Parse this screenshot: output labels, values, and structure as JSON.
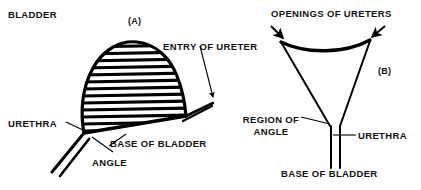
{
  "figure": {
    "background_color": "#ffffff",
    "ink_color": "#000000",
    "panels": [
      {
        "tag": "(A)",
        "view": "lateral-view-of-bladder",
        "labels": [
          {
            "name": "bladder",
            "text": "BLADDER"
          },
          {
            "name": "entry-of-ureter",
            "text": "ENTRY OF URETER"
          },
          {
            "name": "urethra",
            "text": "URETHRA"
          },
          {
            "name": "base-of-bladder",
            "text": "BASE OF BLADDER"
          },
          {
            "name": "angle",
            "text": "ANGLE"
          }
        ]
      },
      {
        "tag": "(B)",
        "view": "posterior-view-of-bladder-base",
        "labels": [
          {
            "name": "openings-of-ureters",
            "text": "OPENINGS OF URETERS"
          },
          {
            "name": "region-of-angle",
            "text": "REGION OF ANGLE"
          },
          {
            "name": "region-of-angle-line1",
            "text": "REGION OF"
          },
          {
            "name": "region-of-angle-line2",
            "text": "ANGLE"
          },
          {
            "name": "urethra",
            "text": "URETHRA"
          },
          {
            "name": "base-of-bladder",
            "text": "BASE OF BLADDER"
          }
        ]
      }
    ]
  },
  "labels": {
    "bladder": "BLADDER",
    "panel_a_tag": "(A)",
    "entry_of_ureter": "ENTRY OF URETER",
    "urethra_a": "URETHRA",
    "base_of_bladder_a": "BASE OF BLADDER",
    "angle": "ANGLE",
    "openings_of_ureters": "OPENINGS OF URETERS",
    "panel_b_tag": "(B)",
    "region_of_angle_line1": "REGION OF",
    "region_of_angle_line2": "ANGLE",
    "urethra_b": "URETHRA",
    "base_of_bladder_b": "BASE OF BLADDER"
  }
}
